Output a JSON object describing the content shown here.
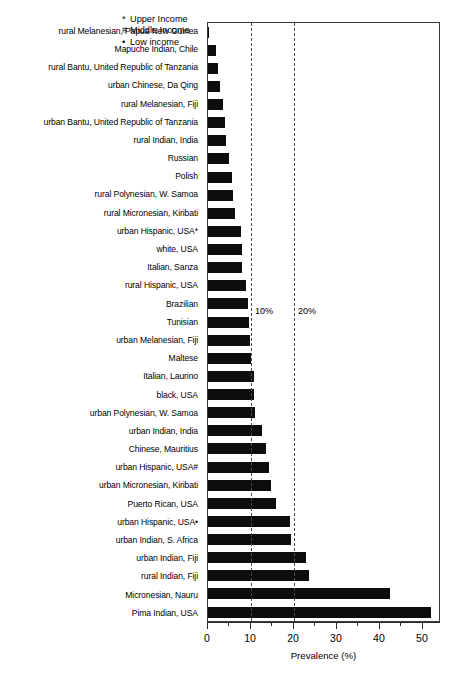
{
  "chart_data": {
    "type": "bar",
    "orientation": "horizontal",
    "title": "",
    "xlabel": "Prevalence (%)",
    "ylabel": "",
    "xlim": [
      0,
      54.2
    ],
    "grid": false,
    "x_ticks": [
      0,
      10,
      20,
      30,
      40,
      50
    ],
    "x_tick_labels": [
      "0",
      "10",
      "20",
      "30",
      "40",
      "50"
    ],
    "x_minor_ticks": [
      5,
      15,
      25,
      35,
      45
    ],
    "annotations": [
      {
        "label": "10%",
        "x": 10
      },
      {
        "label": "20%",
        "x": 20
      }
    ],
    "reference_lines": [
      10,
      20
    ],
    "legend_position": "top-right",
    "legend": [
      {
        "mark": "*",
        "label": "Upper Income"
      },
      {
        "mark": "#",
        "label": "Middle Income"
      },
      {
        "mark": "•",
        "label": "Low income"
      }
    ],
    "categories": [
      "rural Melanesian, Papua New Guinea",
      "Mapuche Indian, Chile",
      "rural Bantu, United Republic of Tanzania",
      "urban Chinese, Da Qing",
      "rural Melanesian, Fiji",
      "urban Bantu, United Republic of Tanzania",
      "rural Indian, India",
      "Russian",
      "Polish",
      "rural Polynesian, W. Samoa",
      "rural Micronesian, Kiribati",
      "urban Hispanic, USA*",
      "white, USA",
      "Italian, Sanza",
      "rural Hispanic, USA",
      "Brazilian",
      "Tunisian",
      "urban Melanesian, Fiji",
      "Maltese",
      "Italian, Laurino",
      "black, USA",
      "urban Polynesian, W. Samoa",
      "urban Indian, India",
      "Chinese, Mauritius",
      "urban Hispanic, USA#",
      "urban Micronesian, Kiribati",
      "Puerto Rican, USA",
      "urban Hispanic, USA•",
      "urban Indian, S. Africa",
      "urban Indian, Fiji",
      "rural Indian, Fiji",
      "Micronesian, Nauru",
      "Pima Indian, USA"
    ],
    "values": [
      0.2,
      1.8,
      2.4,
      2.8,
      3.6,
      4.0,
      4.2,
      4.8,
      5.6,
      5.8,
      6.2,
      7.6,
      7.8,
      8.0,
      8.8,
      9.2,
      9.6,
      9.8,
      9.9,
      10.6,
      10.8,
      10.9,
      12.6,
      13.6,
      14.2,
      14.6,
      15.8,
      19.0,
      19.2,
      22.8,
      23.6,
      42.4,
      51.8
    ],
    "series_color": "#0d0d0d"
  }
}
